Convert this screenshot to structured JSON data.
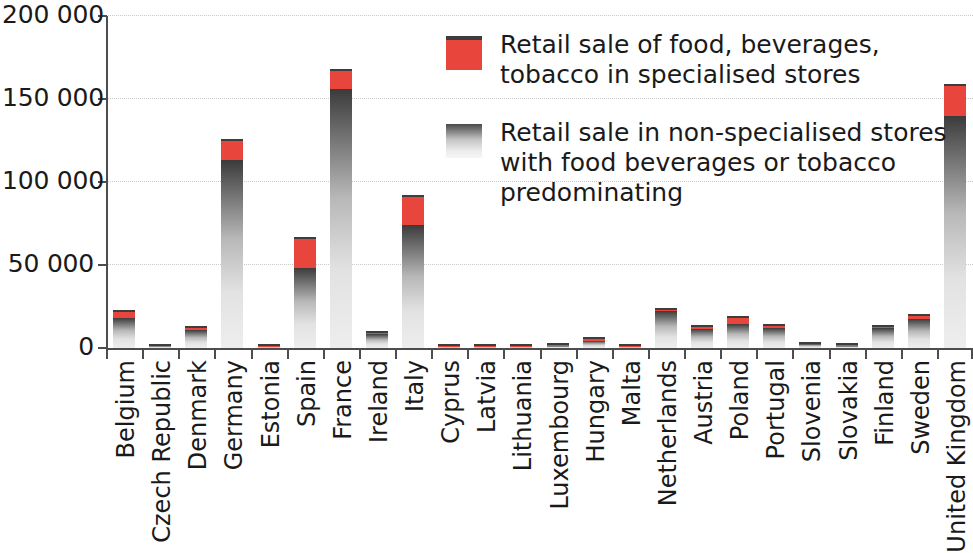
{
  "chart_data": {
    "type": "bar",
    "subtype": "stacked-bar",
    "title": "",
    "subtitle": "",
    "xlabel": "",
    "ylabel": "",
    "ylim": [
      0,
      200000
    ],
    "y_ticks": [
      0,
      50000,
      100000,
      150000,
      200000
    ],
    "y_tick_labels": [
      "0",
      "50 000",
      "100 000",
      "150 000",
      "200 000"
    ],
    "grid": "horizontal-dotted",
    "legend_position": "top-center-right",
    "categories": [
      "Belgium",
      "Czech Republic",
      "Denmark",
      "Germany",
      "Estonia",
      "Spain",
      "France",
      "Ireland",
      "Italy",
      "Cyprus",
      "Latvia",
      "Lithuania",
      "Luxembourg",
      "Hungary",
      "Malta",
      "Netherlands",
      "Austria",
      "Poland",
      "Portugal",
      "Slovenia",
      "Slovakia",
      "Finland",
      "Sweden",
      "United Kingdom"
    ],
    "series": [
      {
        "name": "Retail sale in non-specialised stores with food beverages or tobacco predominating",
        "color": "#b8b8b8",
        "values": [
          18000,
          1000,
          11000,
          113000,
          500,
          48000,
          156000,
          8500,
          74000,
          300,
          600,
          400,
          1300,
          4200,
          700,
          22500,
          11500,
          14500,
          12000,
          2300,
          1400,
          12000,
          17500,
          140000
        ]
      },
      {
        "name": "Retail sale of food, beverages, tobacco in specialised stores",
        "color": "#e8453c",
        "values": [
          5000,
          400,
          2000,
          13000,
          200,
          19000,
          12000,
          2000,
          18000,
          200,
          300,
          200,
          700,
          2300,
          400,
          1500,
          2500,
          4500,
          2500,
          700,
          600,
          2000,
          3000,
          19000
        ]
      }
    ],
    "totals": [
      23000,
      1400,
      13000,
      126000,
      700,
      67000,
      168000,
      10500,
      92000,
      500,
      900,
      600,
      2000,
      6500,
      1100,
      24000,
      14000,
      19000,
      14500,
      3000,
      2000,
      14000,
      20500,
      159000
    ]
  },
  "legend": {
    "items": [
      {
        "swatch": "red-swatch",
        "label": "Retail sale of food, beverages, tobacco in specialised stores"
      },
      {
        "swatch": "gray-gradient-swatch",
        "label": "Retail sale in non-specialised stores with food beverages or tobacco predominating"
      }
    ]
  }
}
